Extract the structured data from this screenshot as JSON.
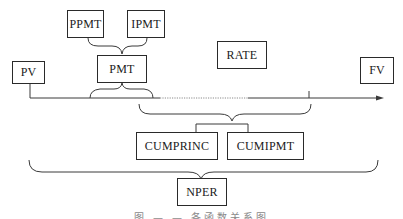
{
  "diagram": {
    "nodes": {
      "ppmt": "PPMT",
      "ipmt": "IPMT",
      "pmt": "PMT",
      "pv": "PV",
      "rate": "RATE",
      "fv": "FV",
      "cumprinc": "CUMPRINC",
      "cumipmt": "CUMIPMT",
      "nper": "NPER"
    },
    "caption": "图 — — 各函数关系图",
    "colors": {
      "line": "#3a3a3a",
      "box_border": "#2a2a2a",
      "text": "#1a1a1a"
    }
  }
}
